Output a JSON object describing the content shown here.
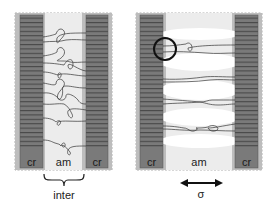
{
  "figure": {
    "panels": [
      {
        "id": "unstrained",
        "labels": {
          "left_crystal": "cr",
          "amorphous": "am",
          "right_crystal": "cr"
        },
        "annotation": "inter"
      },
      {
        "id": "strained",
        "labels": {
          "left_crystal": "cr",
          "amorphous": "am",
          "right_crystal": "cr"
        },
        "annotation": "σ",
        "arrow": "double-headed horizontal"
      }
    ],
    "colors": {
      "crystal": "#7a7a7a",
      "crystal_border": "#a8a8a8",
      "amorphous": "#e9e9e9",
      "void": "#ffffff",
      "chain": "#333333",
      "circle": "#111111"
    }
  }
}
